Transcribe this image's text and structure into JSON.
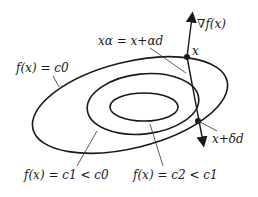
{
  "diagram": {
    "colors": {
      "ink": "#1a1a1a",
      "background": "#ffffff"
    },
    "labels": {
      "gradient": "∇f(x)",
      "x_alpha": "xα = x+αd",
      "point_x": "x",
      "outer_level": "f(x) = c0",
      "middle_level": "f(x) = c1 < c0",
      "inner_level": "f(x) = c2 < c1",
      "x_delta": "x+δd"
    },
    "level_sets": [
      {
        "name": "outer",
        "value": "c0"
      },
      {
        "name": "middle",
        "value": "c1 < c0"
      },
      {
        "name": "inner",
        "value": "c2 < c1"
      }
    ]
  }
}
